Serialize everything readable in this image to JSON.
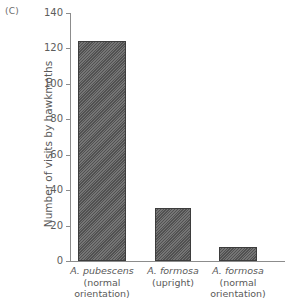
{
  "panel": {
    "label": "(C)"
  },
  "chart_data": {
    "type": "bar",
    "title": "",
    "xlabel": "",
    "ylabel": "Number of visits by hawkmoths",
    "ylim": [
      0,
      140
    ],
    "yticks": [
      0,
      20,
      40,
      60,
      80,
      100,
      120,
      140
    ],
    "ytick_labels": [
      "0",
      "20",
      "40",
      "60",
      "80",
      "100",
      "120",
      "140"
    ],
    "grid": false,
    "legend": "none",
    "categories": [
      "A. pubescens (normal orientation)",
      "A. formosa (upright)",
      "A. formosa (normal orientation)"
    ],
    "category_lines": [
      [
        "A. pubescens",
        "(normal",
        "orientation)"
      ],
      [
        "A. formosa",
        "(upright)",
        ""
      ],
      [
        "A. formosa",
        "(normal",
        "orientation)"
      ]
    ],
    "values": [
      124,
      30,
      8
    ],
    "bar_color": "#5a5a5a",
    "bar_edge_color": "#3d3d3d",
    "bar_fill": "diagonal-hatch"
  }
}
